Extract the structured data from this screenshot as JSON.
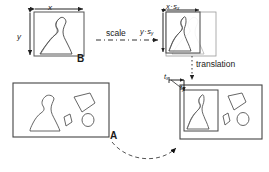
{
  "figure": {
    "type": "diagram",
    "background_color": "#ffffff",
    "stroke_color": "#333333",
    "text_color": "#1a1a1a"
  },
  "labels": {
    "width_x": "x",
    "height_y": "y",
    "template_b": "B",
    "scale_arrow": "scale",
    "scaled_width": "x",
    "scaled_width_operator": "·",
    "scaled_width_factor": "s",
    "scaled_width_factor_sub": "x",
    "scaled_height": "y",
    "scaled_height_operator": "·",
    "scaled_height_factor": "s",
    "scaled_height_factor_sub": "y",
    "translation_arrow": "translation",
    "translate_x": "t",
    "translate_x_sub": "x",
    "translate_y": "t",
    "translate_y_sub": "y",
    "image_a": "A"
  },
  "boxes": {
    "template_box": {
      "name": "B",
      "x": 34,
      "y": 12,
      "width": 50,
      "height": 44,
      "contains": [
        "silhouette-shape"
      ]
    },
    "scaled_box": {
      "name": "B-scaled",
      "x": 166,
      "y": 12,
      "width": 34,
      "height": 41,
      "contains": [
        "silhouette-shape"
      ]
    },
    "ghost_box": {
      "name": "B-original-ghost",
      "x": 166,
      "y": 12,
      "width": 50,
      "height": 44,
      "style": "faint-outline"
    },
    "image_box_a": {
      "name": "A",
      "x": 13,
      "y": 83,
      "width": 96,
      "height": 54,
      "contains": [
        "silhouette-shape",
        "quadrilateral-shape",
        "diamond-shape",
        "ellipse-shape"
      ]
    },
    "image_box_result": {
      "name": "A-with-placed-template",
      "x": 180,
      "y": 85,
      "width": 82,
      "height": 54,
      "contains": [
        "placed-template-box",
        "quadrilateral-shape",
        "diamond-shape",
        "ellipse-shape"
      ]
    },
    "placed_template_box": {
      "name": "B-placed-in-A",
      "x": 184,
      "y": 90,
      "width": 34,
      "height": 41
    }
  },
  "connectors": [
    {
      "name": "scale-connector",
      "style": "dash-dot",
      "direction": "right",
      "from": "template_box",
      "to": "scaled_box"
    },
    {
      "name": "translation-connector",
      "style": "dotted",
      "direction": "down",
      "from": "scaled_box",
      "to": "image_box_result"
    },
    {
      "name": "match-connector",
      "style": "dashed-curve",
      "direction": "right",
      "from": "image_box_a",
      "to": "image_box_result"
    }
  ],
  "dimension_arrows": [
    {
      "name": "x-dimension",
      "orientation": "horizontal",
      "label": "x"
    },
    {
      "name": "y-dimension",
      "orientation": "vertical",
      "label": "y"
    },
    {
      "name": "scaled-x-dimension",
      "orientation": "horizontal",
      "label": "x·sx"
    },
    {
      "name": "scaled-y-dimension",
      "orientation": "vertical",
      "label": "y·sy"
    },
    {
      "name": "tx-offset-arrow",
      "orientation": "horizontal",
      "label": "tx"
    },
    {
      "name": "ty-offset-arrow",
      "orientation": "vertical",
      "label": "ty"
    }
  ]
}
